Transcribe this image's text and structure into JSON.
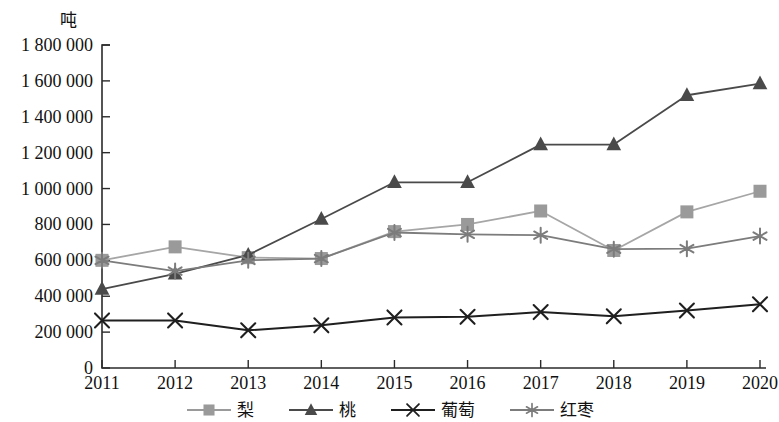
{
  "chart_data": {
    "type": "line",
    "title": "",
    "subtitle": "",
    "xlabel": "",
    "ylabel": "吨",
    "unit_label": "吨",
    "grid": false,
    "legend_position": "bottom",
    "categories": [
      "2011",
      "2012",
      "2013",
      "2014",
      "2015",
      "2016",
      "2017",
      "2018",
      "2019",
      "2020"
    ],
    "x": [
      2011,
      2012,
      2013,
      2014,
      2015,
      2016,
      2017,
      2018,
      2019,
      2020
    ],
    "ylim": [
      0,
      1800000
    ],
    "ytick_step": 200000,
    "ytick_labels": [
      "0",
      "200 000",
      "400 000",
      "600 000",
      "800 000",
      "1 000 000",
      "1 200 000",
      "1 400 000",
      "1 600 000",
      "1 800 000"
    ],
    "ytick_values": [
      0,
      200000,
      400000,
      600000,
      800000,
      1000000,
      1200000,
      1400000,
      1600000,
      1800000
    ],
    "series": [
      {
        "name": "梨",
        "marker": "square",
        "color": "#9a9a9a",
        "line_color": "#a6a6a6",
        "values": [
          600000,
          675000,
          615000,
          610000,
          760000,
          800000,
          875000,
          655000,
          870000,
          985000
        ]
      },
      {
        "name": "桃",
        "marker": "triangle",
        "color": "#4a4a4a",
        "line_color": "#4a4a4a",
        "values": [
          440000,
          525000,
          630000,
          830000,
          1035000,
          1035000,
          1245000,
          1245000,
          1520000,
          1585000
        ]
      },
      {
        "name": "葡萄",
        "marker": "cross",
        "color": "#1f1f1f",
        "line_color": "#1f1f1f",
        "values": [
          265000,
          265000,
          210000,
          238000,
          282000,
          285000,
          312000,
          288000,
          320000,
          355000
        ]
      },
      {
        "name": "红枣",
        "marker": "asterisk",
        "color": "#7c7c7c",
        "line_color": "#7c7c7c",
        "values": [
          600000,
          540000,
          600000,
          610000,
          755000,
          745000,
          740000,
          662000,
          665000,
          735000
        ]
      }
    ]
  },
  "legend": {
    "items": [
      {
        "label": "梨",
        "marker": "square",
        "color": "#9a9a9a"
      },
      {
        "label": "桃",
        "marker": "triangle",
        "color": "#4a4a4a"
      },
      {
        "label": "葡萄",
        "marker": "cross",
        "color": "#1f1f1f"
      },
      {
        "label": "红枣",
        "marker": "asterisk",
        "color": "#7c7c7c"
      }
    ]
  },
  "colors": {
    "axis": "#2b2b2b",
    "text": "#111111",
    "background": "#ffffff"
  }
}
